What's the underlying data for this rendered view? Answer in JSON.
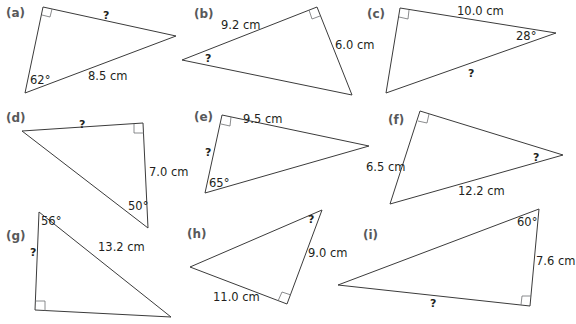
{
  "colors": {
    "line": "#3b3b3b",
    "text": "#231f20",
    "part_label": "#58595b",
    "background": "#ffffff"
  },
  "triangles": [
    {
      "part": "(a)",
      "vertices": [
        [
          43,
          7
        ],
        [
          176,
          36
        ],
        [
          25,
          93
        ]
      ],
      "right_angle_at": 0,
      "labels": {
        "hyp": "8.5 cm",
        "angle": "62°",
        "unknown": "?"
      }
    },
    {
      "part": "(b)",
      "vertices": [
        [
          317,
          7
        ],
        [
          182,
          60
        ],
        [
          352,
          95
        ]
      ],
      "right_angle_at": 0,
      "labels": {
        "side1": "9.2 cm",
        "side2": "6.0 cm",
        "unknown": "?"
      }
    },
    {
      "part": "(c)",
      "vertices": [
        [
          400,
          8
        ],
        [
          556,
          33
        ],
        [
          386,
          93
        ]
      ],
      "right_angle_at": 0,
      "labels": {
        "side": "10.0 cm",
        "angle": "28°",
        "unknown": "?"
      }
    },
    {
      "part": "(d)",
      "vertices": [
        [
          143,
          123
        ],
        [
          22,
          131
        ],
        [
          148,
          228
        ]
      ],
      "right_angle_at": 0,
      "labels": {
        "side": "7.0 cm",
        "angle": "50°",
        "unknown": "?"
      }
    },
    {
      "part": "(e)",
      "vertices": [
        [
          222,
          115
        ],
        [
          369,
          146
        ],
        [
          205,
          193
        ]
      ],
      "right_angle_at": 0,
      "labels": {
        "side": "9.5 cm",
        "angle": "65°",
        "unknown": "?"
      }
    },
    {
      "part": "(f)",
      "vertices": [
        [
          420,
          111
        ],
        [
          563,
          155
        ],
        [
          390,
          204
        ]
      ],
      "right_angle_at": 0,
      "labels": {
        "side": "6.5 cm",
        "hyp": "12.2 cm",
        "unknown": "?"
      }
    },
    {
      "part": "(g)",
      "vertices": [
        [
          35,
          310
        ],
        [
          39,
          212
        ],
        [
          171,
          317
        ]
      ],
      "right_angle_at": 0,
      "labels": {
        "hyp": "13.2 cm",
        "angle": "56°",
        "unknown": "?"
      }
    },
    {
      "part": "(h)",
      "vertices": [
        [
          287,
          304
        ],
        [
          322,
          210
        ],
        [
          190,
          267
        ]
      ],
      "right_angle_at": 0,
      "labels": {
        "side1": "9.0 cm",
        "side2": "11.0 cm",
        "unknown": "?"
      }
    },
    {
      "part": "(i)",
      "vertices": [
        [
          530,
          306
        ],
        [
          539,
          209
        ],
        [
          338,
          285
        ]
      ],
      "right_angle_at": 0,
      "labels": {
        "side": "7.6 cm",
        "angle": "60°",
        "unknown": "?"
      }
    }
  ]
}
